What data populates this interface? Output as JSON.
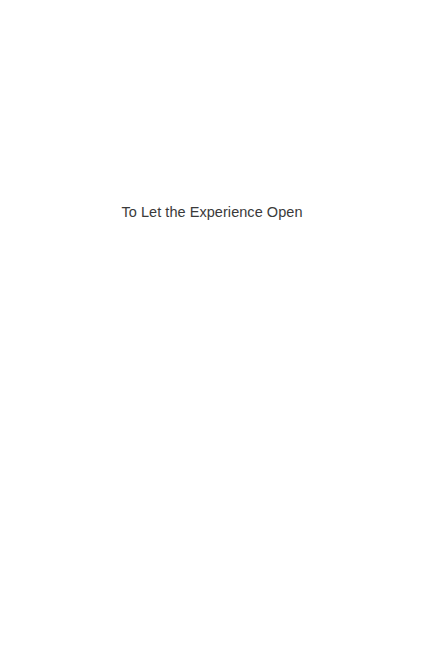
{
  "page": {
    "type": "half-title",
    "title": "To Let the Experience Open"
  }
}
